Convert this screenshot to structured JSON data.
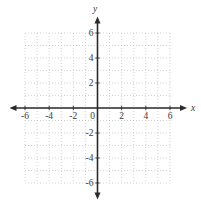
{
  "figure": {
    "kind": "blank-coordinate-plane",
    "background_color": "#ffffff",
    "axis_color": "#2a2a2a",
    "grid_color": "#c6c6c6",
    "label_color": "#3a3a3a",
    "x_axis_letter": "x",
    "y_axis_letter": "y",
    "origin_label": "0"
  },
  "chart_data": {
    "type": "scatter",
    "points": [],
    "title": "",
    "xlabel": "x",
    "ylabel": "y",
    "xlim": [
      -6,
      6
    ],
    "ylim": [
      -6,
      6
    ],
    "grid": true,
    "grid_step": 1,
    "x_ticks": [
      -6,
      -4,
      -2,
      0,
      2,
      4,
      6
    ],
    "x_tick_labels": [
      "-6",
      "-4",
      "-2",
      "0",
      "2",
      "4",
      "6"
    ],
    "y_ticks": [
      6,
      4,
      2,
      -2,
      -4,
      -6
    ],
    "y_tick_labels": [
      "6",
      "4",
      "2",
      "-2",
      "-4",
      "-6"
    ],
    "legend": null,
    "annotations": []
  }
}
